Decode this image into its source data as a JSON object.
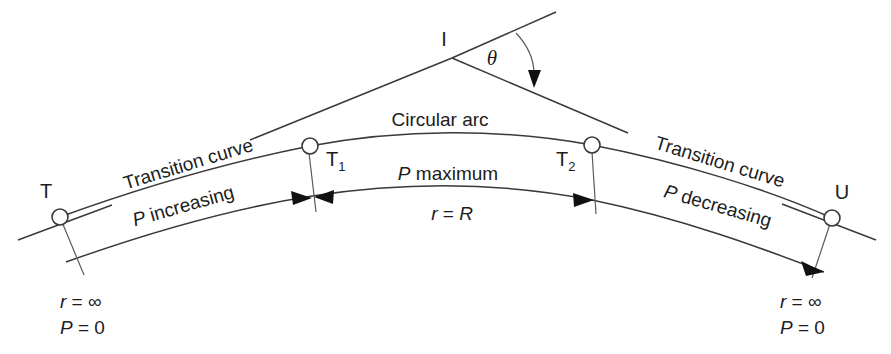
{
  "diagram": {
    "labels": {
      "intersection_point": "I",
      "theta": "θ",
      "circular_arc": "Circular arc",
      "transition_curve_left": "Transition curve",
      "transition_curve_right": "Transition curve",
      "p_increasing": "P increasing",
      "p_maximum": "P maximum",
      "p_decreasing": "P decreasing",
      "radius_equals_R": "r = R",
      "point_T": "T",
      "point_T1": "T",
      "point_T1_sub": "1",
      "point_T2": "T",
      "point_T2_sub": "2",
      "point_U": "U",
      "left_note_radius": "r = ∞",
      "left_note_pressure": "P = 0",
      "right_note_radius": "r = ∞",
      "right_note_pressure": "P = 0"
    },
    "italic_parts": {
      "r_symbol": "r",
      "P_symbol": "P",
      "R_symbol": "R",
      "equals_infinity": "= ∞",
      "equals_zero": "= 0",
      "equals_R": "= ",
      "maximum_word": "maximum",
      "increasing_word": "increasing",
      "decreasing_word": "decreasing"
    },
    "colors": {
      "stroke": "#3a3a3a",
      "stroke_light": "#5a5a5a",
      "text": "#1c1c1c",
      "background": "#ffffff",
      "arrow_fill": "#111111"
    },
    "geometry": {
      "point_T": [
        60,
        217
      ],
      "point_T1": [
        310,
        146
      ],
      "point_T2": [
        592,
        145
      ],
      "point_U": [
        832,
        218
      ],
      "point_I": [
        452,
        58
      ],
      "node_radius": 8
    }
  }
}
